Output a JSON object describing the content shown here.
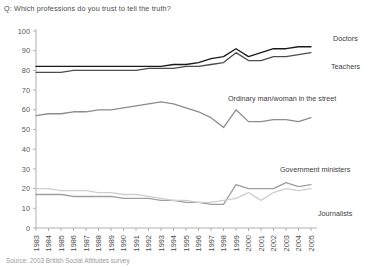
{
  "header": {
    "question": "Q: Which professions do you trust to tell the truth?"
  },
  "footer": {
    "source": "Source: 2003 British Social Attitudes survey"
  },
  "labels": {
    "doctors": "Doctors",
    "teachers": "Teachers",
    "ordinary": "Ordinary man/woman in the street",
    "ministers": "Government ministers",
    "journalists": "Journalists"
  },
  "colors": {
    "doctors": "#1a1a1a",
    "teachers": "#4d4d4d",
    "ordinary": "#8c8c8c",
    "ministers": "#9e9e9e",
    "journalists": "#cfcfcf",
    "axis": "#b0b0b0",
    "text": "#4a4a4a"
  },
  "chart_data": {
    "type": "line",
    "title": "Q: Which professions do you trust to tell the truth?",
    "xlabel": "",
    "ylabel": "",
    "ylim": [
      0,
      100
    ],
    "yticks": [
      0,
      10,
      20,
      30,
      40,
      50,
      60,
      70,
      80,
      90,
      100
    ],
    "grid": false,
    "legend": "inline-right",
    "categories": [
      "1983",
      "1984",
      "1985",
      "1986",
      "1987",
      "1988",
      "1989",
      "1990",
      "1991",
      "1992",
      "1993",
      "1994",
      "1995",
      "1996",
      "1997",
      "1998",
      "1999",
      "2000",
      "2001",
      "2002",
      "2003",
      "2004",
      "2005"
    ],
    "series": [
      {
        "name": "Doctors",
        "color": "#1a1a1a",
        "values": [
          82,
          82,
          82,
          82,
          82,
          82,
          82,
          82,
          82,
          82,
          82,
          83,
          83,
          84,
          86,
          87,
          91,
          87,
          89,
          91,
          91,
          92,
          92
        ]
      },
      {
        "name": "Teachers",
        "color": "#4d4d4d",
        "values": [
          79,
          79,
          79,
          80,
          80,
          80,
          80,
          80,
          80,
          81,
          81,
          81,
          82,
          82,
          83,
          84,
          89,
          85,
          85,
          87,
          87,
          88,
          89
        ]
      },
      {
        "name": "Ordinary man/woman in the street",
        "color": "#8c8c8c",
        "values": [
          57,
          58,
          58,
          59,
          59,
          60,
          60,
          61,
          62,
          63,
          64,
          63,
          61,
          59,
          56,
          51,
          60,
          54,
          54,
          55,
          55,
          54,
          56
        ]
      },
      {
        "name": "Government ministers",
        "color": "#9e9e9e",
        "values": [
          17,
          17,
          17,
          16,
          16,
          16,
          16,
          15,
          15,
          15,
          14,
          14,
          13,
          13,
          12,
          12,
          22,
          20,
          20,
          20,
          23,
          21,
          22
        ]
      },
      {
        "name": "Journalists",
        "color": "#cfcfcf",
        "values": [
          20,
          20,
          19,
          19,
          19,
          18,
          18,
          17,
          17,
          16,
          15,
          14,
          14,
          13,
          13,
          14,
          15,
          18,
          14,
          18,
          20,
          19,
          20
        ]
      }
    ],
    "annotations": [
      {
        "text": "Doctors",
        "series": "Doctors"
      },
      {
        "text": "Teachers",
        "series": "Teachers"
      },
      {
        "text": "Ordinary man/woman in the street",
        "series": "Ordinary man/woman in the street"
      },
      {
        "text": "Government ministers",
        "series": "Government ministers"
      },
      {
        "text": "Journalists",
        "series": "Journalists"
      }
    ]
  }
}
